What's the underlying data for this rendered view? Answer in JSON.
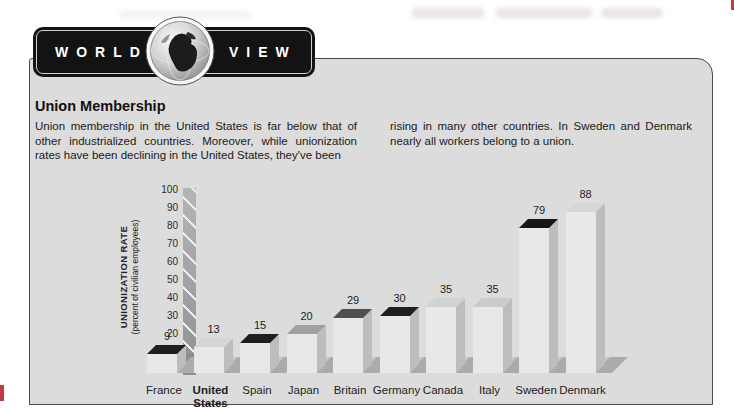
{
  "banner": {
    "word_left": "WORLD",
    "word_right": "VIEW",
    "bg": "#131313"
  },
  "article": {
    "title": "Union Membership",
    "left_column": "Union membership in the United States is far below that of other industrialized countries. Moreover, while unionization rates have been declining in the United States, they've been",
    "right_column": "rising in many other countries. In Sweden and Denmark nearly all workers belong to a union."
  },
  "chart_data": {
    "type": "bar",
    "projection": "3d-oblique",
    "title": "",
    "ylabel": "UNIONIZATION RATE",
    "ylabel_sub": "(percent of civilian employees)",
    "xlabel": "",
    "ylim": [
      0,
      100
    ],
    "ytick_step": 10,
    "grid": false,
    "legend": false,
    "categories": [
      "France",
      "United States",
      "Spain",
      "Japan",
      "Britain",
      "Germany",
      "Canada",
      "Italy",
      "Sweden",
      "Denmark"
    ],
    "values": [
      9,
      13,
      15,
      20,
      29,
      30,
      35,
      35,
      79,
      88
    ],
    "bold_category": "United States",
    "bar_front_color": "#e8e8e8",
    "bar_side_color": "#bdbdbd",
    "cap_colors": [
      "#1f1f1f",
      "#d6d6d6",
      "#1f1f1f",
      "#a0a0a0",
      "#4f4f4f",
      "#1f1f1f",
      "#d2d2d2",
      "#cbcbcb",
      "#151515",
      "#d6d6d6"
    ]
  },
  "colors": {
    "panel_bg": "#dcdcdc",
    "panel_border": "#4b4b4b",
    "page_edge_red": "#c43a3f",
    "axis_wall": "#a8a8a8",
    "floor": "#c6c6c6",
    "bar_shadow": "#ababab"
  }
}
